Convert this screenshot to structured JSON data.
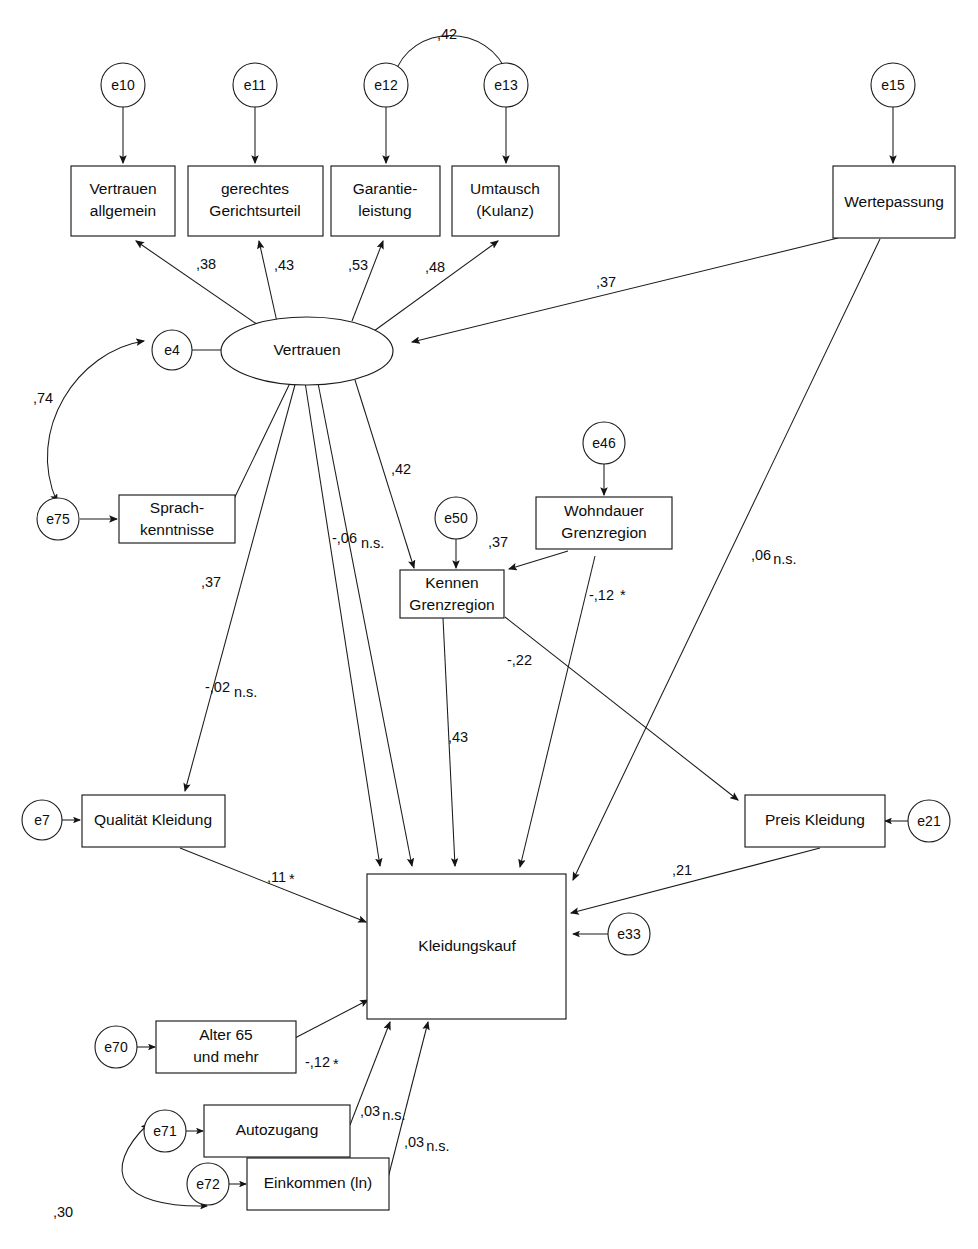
{
  "diagram": {
    "type": "path-diagram",
    "background_color": "#ffffff",
    "line_color": "#1a1a1a",
    "decimal_separator": ","
  },
  "latent_variables": [
    {
      "id": "vertrauen",
      "label": "Vertrauen",
      "shape": "ellipse"
    }
  ],
  "observed_variables": [
    {
      "id": "vertrauen_allgemein",
      "label_line1": "Vertrauen",
      "label_line2": "allgemein"
    },
    {
      "id": "gerechtes_gerichtsurteil",
      "label_line1": "gerechtes",
      "label_line2": "Gerichtsurteil"
    },
    {
      "id": "garantieleistung",
      "label_line1": "Garantie-",
      "label_line2": "leistung"
    },
    {
      "id": "umtausch_kulanz",
      "label_line1": "Umtausch",
      "label_line2": "(Kulanz)"
    },
    {
      "id": "wertepassung",
      "label_line1": "Wertepassung",
      "label_line2": ""
    },
    {
      "id": "sprachkenntnisse",
      "label_line1": "Sprach-",
      "label_line2": "kenntnisse"
    },
    {
      "id": "kennen_grenzregion",
      "label_line1": "Kennen",
      "label_line2": "Grenzregion"
    },
    {
      "id": "wohndauer_grenzregion",
      "label_line1": "Wohndauer",
      "label_line2": "Grenzregion"
    },
    {
      "id": "qualitaet_kleidung",
      "label_line1": "Qualität Kleidung",
      "label_line2": ""
    },
    {
      "id": "preis_kleidung",
      "label_line1": "Preis Kleidung",
      "label_line2": ""
    },
    {
      "id": "kleidungskauf",
      "label_line1": "Kleidungskauf",
      "label_line2": ""
    },
    {
      "id": "alter_65",
      "label_line1": "Alter 65",
      "label_line2": "und mehr"
    },
    {
      "id": "autozugang",
      "label_line1": "Autozugang",
      "label_line2": ""
    },
    {
      "id": "einkommen_ln",
      "label_line1": "Einkommen (ln)",
      "label_line2": ""
    }
  ],
  "error_terms": [
    {
      "id": "e10",
      "label": "e10"
    },
    {
      "id": "e11",
      "label": "e11"
    },
    {
      "id": "e12",
      "label": "e12"
    },
    {
      "id": "e13",
      "label": "e13"
    },
    {
      "id": "e15",
      "label": "e15"
    },
    {
      "id": "e4",
      "label": "e4"
    },
    {
      "id": "e75",
      "label": "e75"
    },
    {
      "id": "e50",
      "label": "e50"
    },
    {
      "id": "e46",
      "label": "e46"
    },
    {
      "id": "e7",
      "label": "e7"
    },
    {
      "id": "e21",
      "label": "e21"
    },
    {
      "id": "e33",
      "label": "e33"
    },
    {
      "id": "e70",
      "label": "e70"
    },
    {
      "id": "e71",
      "label": "e71"
    },
    {
      "id": "e72",
      "label": "e72"
    }
  ],
  "coefficients": {
    "e12_e13_correlation": ",42",
    "vertrauen_to_vertrauen_allgemein": ",38",
    "vertrauen_to_gerechtes": ",43",
    "vertrauen_to_garantie": ",53",
    "vertrauen_to_umtausch": ",48",
    "wertepassung_to_vertrauen": ",37",
    "e4_e75_correlation": ",74",
    "vertrauen_to_sprachkenntnisse": ",37",
    "vertrauen_to_kennen_grenzregion": ",42",
    "vertrauen_to_kleidungskauf_a": "-,06",
    "vertrauen_to_kleidungskauf_a_sig": "n.s.",
    "vertrauen_to_qualitaet": ",37",
    "vertrauen_to_kleidungskauf_b": "-,02",
    "vertrauen_to_kleidungskauf_b_sig": "n.s.",
    "wohndauer_to_kennen": ",37",
    "wohndauer_to_kleidungskauf": "-,12",
    "wohndauer_to_kleidungskauf_sig": "*",
    "kennen_to_preis": "-,22",
    "kennen_to_kleidungskauf": ",43",
    "wertepassung_to_kleidungskauf": ",06",
    "wertepassung_to_kleidungskauf_sig": "n.s.",
    "qualitaet_to_kleidungskauf": ",11",
    "qualitaet_to_kleidungskauf_sig": "*",
    "preis_to_kleidungskauf": ",21",
    "alter_to_kleidungskauf": "-,12",
    "alter_to_kleidungskauf_sig": "*",
    "autozugang_to_kleidungskauf": ",03",
    "autozugang_to_kleidungskauf_sig": "n.s.",
    "einkommen_to_kleidungskauf": ",03",
    "einkommen_to_kleidungskauf_sig": "n.s.",
    "e71_e72_correlation": ",30"
  }
}
